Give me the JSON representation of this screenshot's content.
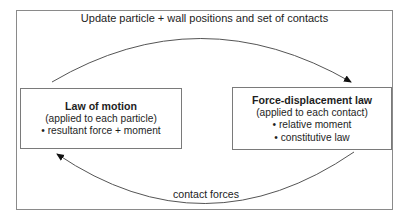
{
  "diagram": {
    "title": "Update particle + wall positions and set of contacts",
    "left_box": {
      "title": "Law of motion",
      "subtitle": "(applied to each particle)",
      "bullets": [
        "• resultant force + moment"
      ]
    },
    "right_box": {
      "title": "Force-displacement law",
      "subtitle": "(applied to each contact)",
      "bullets": [
        "• relative moment",
        "• constitutive law"
      ]
    },
    "bottom_label": "contact forces",
    "arrows": [
      {
        "from": "left_box",
        "to": "right_box",
        "label": "Update particle + wall positions and set of contacts",
        "path": "top-arc"
      },
      {
        "from": "right_box",
        "to": "left_box",
        "label": "contact forces",
        "path": "bottom-arc"
      }
    ],
    "colors": {
      "line": "#555555",
      "frame": "#8a8a8a",
      "text": "#1e1e1e",
      "background": "#ffffff"
    }
  }
}
